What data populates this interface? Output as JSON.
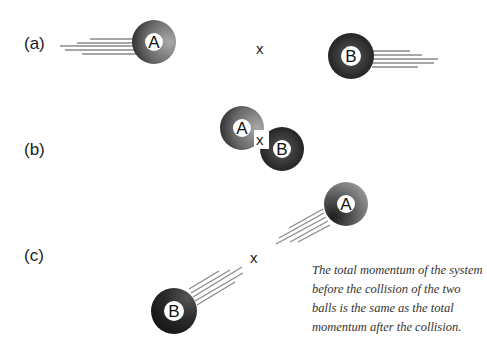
{
  "panels": [
    {
      "label": "(a)",
      "balls": [
        {
          "name": "A"
        },
        {
          "name": "B"
        }
      ],
      "center_mark": "x"
    },
    {
      "label": "(b)",
      "balls": [
        {
          "name": "A"
        },
        {
          "name": "B"
        }
      ],
      "center_mark": "x"
    },
    {
      "label": "(c)",
      "balls": [
        {
          "name": "A"
        },
        {
          "name": "B"
        }
      ],
      "center_mark": "x"
    }
  ],
  "caption": "The total momentum of the system before the collision of the two balls is the same as the total momentum after the collision.",
  "colors": {
    "ball_a_light": "#9a9a9a",
    "ball_a_dark": "#333333",
    "ball_b_light": "#555555",
    "ball_b_dark": "#111111",
    "motion_lines": "#777777"
  }
}
